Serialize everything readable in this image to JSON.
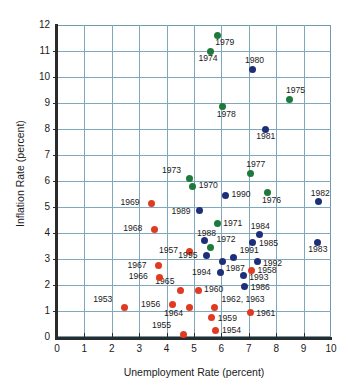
{
  "chart_data": {
    "type": "scatter",
    "title": "",
    "xlabel": "Unemployment Rate (percent)",
    "ylabel": "Inflation Rate (percent)",
    "xlim": [
      0,
      10
    ],
    "ylim": [
      0,
      12
    ],
    "xticks": [
      "0",
      "1",
      "2",
      "3",
      "4",
      "5",
      "6",
      "7",
      "8",
      "9",
      "10"
    ],
    "yticks": [
      "0",
      "1",
      "2",
      "3",
      "4",
      "5",
      "6",
      "7",
      "8",
      "9",
      "10",
      "11",
      "12"
    ],
    "grid": true,
    "legend": "none",
    "series": [
      {
        "name": "1953-1969",
        "color": "#e03a21",
        "points": [
          {
            "label": "1953",
            "x": 2.45,
            "y": 1.15,
            "lx": -31,
            "ly": -12
          },
          {
            "label": "1954",
            "x": 5.8,
            "y": 0.25,
            "lx": 6,
            "ly": -5
          },
          {
            "label": "1955",
            "x": 4.6,
            "y": 0.1,
            "lx": -31,
            "ly": -13
          },
          {
            "label": "1956",
            "x": 4.2,
            "y": 1.25,
            "lx": -31,
            "ly": -5
          },
          {
            "label": "1957",
            "x": 4.85,
            "y": 3.3,
            "lx": -31,
            "ly": -5
          },
          {
            "label": "1958",
            "x": 7.1,
            "y": 2.55,
            "lx": 6,
            "ly": -5
          },
          {
            "label": "1959",
            "x": 5.65,
            "y": 0.75,
            "lx": 6,
            "ly": -4
          },
          {
            "label": "1960",
            "x": 5.15,
            "y": 1.8,
            "lx": 6,
            "ly": -5
          },
          {
            "label": "1961",
            "x": 7.05,
            "y": 0.95,
            "lx": 6,
            "ly": -3
          },
          {
            "label": "1962, 1963",
            "x": 5.75,
            "y": 1.15,
            "lx": 7,
            "ly": -12
          },
          {
            "label": "1964",
            "x": 4.85,
            "y": 1.15,
            "lx": -26,
            "ly": 2
          },
          {
            "label": "1965",
            "x": 4.5,
            "y": 1.8,
            "lx": -25,
            "ly": -13
          },
          {
            "label": "1966",
            "x": 3.75,
            "y": 2.3,
            "lx": -31,
            "ly": -5
          },
          {
            "label": "1967",
            "x": 3.7,
            "y": 2.75,
            "lx": -31,
            "ly": -5
          },
          {
            "label": "1968",
            "x": 3.55,
            "y": 4.15,
            "lx": -31,
            "ly": -5
          },
          {
            "label": "1969",
            "x": 3.45,
            "y": 5.15,
            "lx": -31,
            "ly": -5
          }
        ]
      },
      {
        "name": "1970-1979",
        "color": "#1d7a3a",
        "points": [
          {
            "label": "1970",
            "x": 4.95,
            "y": 5.8,
            "lx": 6,
            "ly": -5
          },
          {
            "label": "1971",
            "x": 5.85,
            "y": 4.35,
            "lx": 6,
            "ly": -5
          },
          {
            "label": "1972",
            "x": 5.6,
            "y": 3.45,
            "lx": 6,
            "ly": -12
          },
          {
            "label": "1973",
            "x": 4.85,
            "y": 6.1,
            "lx": -28,
            "ly": -12
          },
          {
            "label": "1974",
            "x": 5.6,
            "y": 11.0,
            "lx": -12,
            "ly": 3
          },
          {
            "label": "1975",
            "x": 8.5,
            "y": 9.15,
            "lx": -4,
            "ly": -13
          },
          {
            "label": "1976",
            "x": 7.7,
            "y": 5.55,
            "lx": -6,
            "ly": 3
          },
          {
            "label": "1977",
            "x": 7.05,
            "y": 6.3,
            "lx": -4,
            "ly": -13
          },
          {
            "label": "1978",
            "x": 6.05,
            "y": 8.85,
            "lx": -6,
            "ly": 3
          },
          {
            "label": "1979",
            "x": 5.85,
            "y": 11.6,
            "lx": -2,
            "ly": 3
          }
        ]
      },
      {
        "name": "1980-1995",
        "color": "#1e2f7a",
        "points": [
          {
            "label": "1980",
            "x": 7.15,
            "y": 10.3,
            "lx": -8,
            "ly": -13
          },
          {
            "label": "1981",
            "x": 7.6,
            "y": 8.0,
            "lx": -9,
            "ly": 3
          },
          {
            "label": "1982",
            "x": 9.55,
            "y": 5.2,
            "lx": -8,
            "ly": -13
          },
          {
            "label": "1983",
            "x": 9.5,
            "y": 3.65,
            "lx": -9,
            "ly": 3
          },
          {
            "label": "1984",
            "x": 7.4,
            "y": 3.95,
            "lx": -9,
            "ly": -12
          },
          {
            "label": "1985",
            "x": 7.15,
            "y": 3.65,
            "lx": 6,
            "ly": -3
          },
          {
            "label": "1986",
            "x": 6.85,
            "y": 1.95,
            "lx": 6,
            "ly": -3
          },
          {
            "label": "1987",
            "x": 6.05,
            "y": 2.9,
            "lx": 3,
            "ly": 2
          },
          {
            "label": "1988",
            "x": 5.4,
            "y": 3.7,
            "lx": -8,
            "ly": -12
          },
          {
            "label": "1989",
            "x": 5.2,
            "y": 4.85,
            "lx": -28,
            "ly": -4
          },
          {
            "label": "1990",
            "x": 6.15,
            "y": 5.45,
            "lx": 6,
            "ly": -5
          },
          {
            "label": "1991",
            "x": 6.45,
            "y": 3.05,
            "lx": 6,
            "ly": -12
          },
          {
            "label": "1992",
            "x": 7.3,
            "y": 2.9,
            "lx": 6,
            "ly": -3
          },
          {
            "label": "1993",
            "x": 6.8,
            "y": 2.35,
            "lx": 6,
            "ly": -3
          },
          {
            "label": "1994",
            "x": 5.95,
            "y": 2.5,
            "lx": -28,
            "ly": -4
          },
          {
            "label": "1995",
            "x": 5.45,
            "y": 3.15,
            "lx": -28,
            "ly": -4
          }
        ]
      }
    ]
  }
}
